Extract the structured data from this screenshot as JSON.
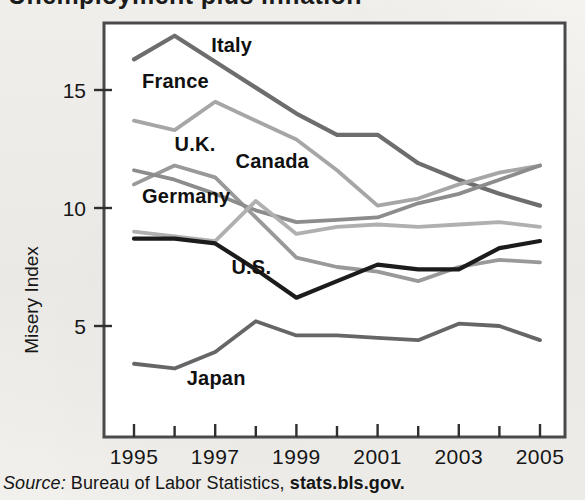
{
  "page": {
    "background_color": "#f2f1ee",
    "cropped_title_fragment": "Unemployment plus inflation"
  },
  "source": {
    "prefix": "Source:",
    "text": "Bureau of Labor Statistics,",
    "emphasis": "stats.bls.gov."
  },
  "axes": {
    "y_title": "Misery Index",
    "y_ticks": [
      "5",
      "10",
      "15"
    ],
    "x_ticks": [
      "1995",
      "1997",
      "1999",
      "2001",
      "2003",
      "2005"
    ]
  },
  "chart_data": {
    "type": "line",
    "title": "",
    "subtitle": "",
    "xlabel": "",
    "ylabel": "Misery Index",
    "x": [
      1995,
      1996,
      1997,
      1998,
      1999,
      2000,
      2001,
      2002,
      2003,
      2004,
      2005
    ],
    "xlim": [
      1995,
      2005
    ],
    "ylim": [
      0,
      18
    ],
    "y_tick_values": [
      5,
      10,
      15
    ],
    "x_tick_values": [
      1995,
      1997,
      1999,
      2001,
      2003,
      2005
    ],
    "x_minor_tick_values": [
      1996,
      1998,
      2000,
      2002,
      2004
    ],
    "grid": false,
    "legend": "inline-labels",
    "series": [
      {
        "name": "Italy",
        "color": "#6d6d6d",
        "label_x": 1996.9,
        "label_y": 16.6,
        "values": [
          16.3,
          17.3,
          16.2,
          15.1,
          14.0,
          13.1,
          13.1,
          11.9,
          11.2,
          10.6,
          10.1
        ]
      },
      {
        "name": "France",
        "color": "#a6a6a6",
        "label_x": 1995.2,
        "label_y": 15.1,
        "values": [
          13.7,
          13.3,
          14.5,
          13.7,
          12.9,
          11.6,
          10.1,
          10.4,
          11.0,
          11.5,
          11.8
        ]
      },
      {
        "name": "U.K.",
        "color": "#999999",
        "label_x": 1996.0,
        "label_y": 12.4,
        "values": [
          11.0,
          11.8,
          11.3,
          9.6,
          7.9,
          7.5,
          7.3,
          6.9,
          7.5,
          7.8,
          7.7
        ]
      },
      {
        "name": "Canada",
        "color": "#8c8c8c",
        "label_x": 1997.5,
        "label_y": 11.7,
        "values": [
          11.6,
          11.2,
          10.6,
          9.9,
          9.4,
          9.5,
          9.6,
          10.2,
          10.6,
          11.2,
          11.8
        ]
      },
      {
        "name": "Germany",
        "color": "#b0b0b0",
        "label_x": 1995.2,
        "label_y": 10.2,
        "values": [
          9.0,
          8.8,
          8.6,
          10.3,
          8.9,
          9.2,
          9.3,
          9.2,
          9.3,
          9.4,
          9.2
        ]
      },
      {
        "name": "U.S.",
        "color": "#1c1c1c",
        "label_x": 1997.4,
        "label_y": 7.2,
        "values": [
          8.7,
          8.7,
          8.5,
          7.4,
          6.2,
          6.9,
          7.6,
          7.4,
          7.4,
          8.3,
          8.6
        ]
      },
      {
        "name": "Japan",
        "color": "#666666",
        "label_x": 1996.3,
        "label_y": 2.5,
        "values": [
          3.4,
          3.2,
          3.9,
          5.2,
          4.6,
          4.6,
          4.5,
          4.4,
          5.1,
          5.0,
          4.4
        ]
      }
    ]
  }
}
